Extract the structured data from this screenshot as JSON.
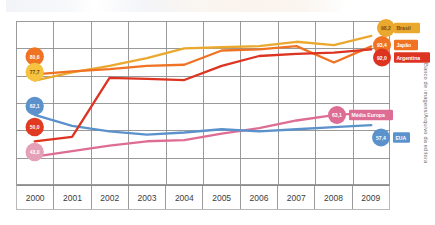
{
  "figure": {
    "credit": "Banco de imagens/Arquivo da editora",
    "title_ghost": ""
  },
  "axis": {
    "years": [
      "2000",
      "2001",
      "2002",
      "2003",
      "2004",
      "2005",
      "2006",
      "2007",
      "2008",
      "2009"
    ]
  },
  "chart_data": {
    "type": "line",
    "title": "",
    "xlabel": "",
    "ylabel": "",
    "x": [
      2000,
      2001,
      2002,
      2003,
      2004,
      2005,
      2006,
      2007,
      2008,
      2009
    ],
    "categories": [
      "2000",
      "2001",
      "2002",
      "2003",
      "2004",
      "2005",
      "2006",
      "2007",
      "2008",
      "2009"
    ],
    "xlim": [
      2000,
      2009
    ],
    "ylim": [
      30,
      105
    ],
    "grid": true,
    "legend": "right-inline-labels",
    "colors": {
      "brasil": "#eaa92e",
      "japao": "#ef7322",
      "argentina": "#dd3321",
      "media_europa": "#dd6d94",
      "eua": "#5b92cc"
    },
    "series": [
      {
        "name": "Brasil",
        "color": "#eaa92e",
        "start_value": "77,7",
        "end_value": "98,2",
        "values": [
          77.7,
          81.5,
          84.5,
          88.0,
          92.5,
          93.0,
          93.5,
          95.5,
          94.0,
          98.2
        ]
      },
      {
        "name": "Japão",
        "color": "#ef7322",
        "start_value": "80,6",
        "end_value": "93,4",
        "values": [
          80.6,
          82.0,
          83.0,
          84.5,
          85.0,
          91.5,
          92.0,
          93.5,
          86.0,
          93.4
        ]
      },
      {
        "name": "Argentina",
        "color": "#dd3321",
        "start_value": "50,0",
        "end_value": "92,0",
        "values": [
          50.0,
          52.0,
          79.0,
          78.5,
          78.0,
          84.5,
          89.0,
          90.0,
          90.5,
          92.0
        ]
      },
      {
        "name": "Média Europa",
        "color": "#dd6d94",
        "start_value": "43,0",
        "end_value": "63,1",
        "values": [
          43.0,
          45.5,
          48.0,
          50.0,
          50.5,
          53.5,
          56.0,
          59.5,
          62.0,
          63.1
        ]
      },
      {
        "name": "EUA",
        "color": "#5b92cc",
        "start_value": "62,1",
        "end_value": "57,4",
        "values": [
          62.1,
          57.0,
          54.5,
          53.0,
          54.0,
          55.5,
          54.5,
          55.5,
          56.5,
          57.4
        ]
      }
    ],
    "start_markers": [
      {
        "series": "Japão",
        "label": "80,6",
        "color": "#ef7322"
      },
      {
        "series": "Brasil",
        "label": "77,7",
        "color": "#f5c33e"
      },
      {
        "series": "EUA",
        "label": "62,1",
        "color": "#5b92cc"
      },
      {
        "series": "Argentina",
        "label": "50,0",
        "color": "#e03a22"
      },
      {
        "series": "Média Europa",
        "label": "43,0",
        "color": "#e3a0b6"
      }
    ],
    "end_markers": [
      {
        "series": "Brasil",
        "label": "98,2",
        "tag": "Brasil",
        "color": "#eaa92e"
      },
      {
        "series": "Japão",
        "label": "93,4",
        "tag": "Japão",
        "color": "#ef7322"
      },
      {
        "series": "Argentina",
        "label": "92,0",
        "tag": "Argentina",
        "color": "#dd3321"
      },
      {
        "series": "Média Europa",
        "label": "63,1",
        "tag": "Média Europa",
        "color": "#dd6d94"
      },
      {
        "series": "EUA",
        "label": "57,4",
        "tag": "EUA",
        "color": "#5b92cc"
      }
    ]
  }
}
